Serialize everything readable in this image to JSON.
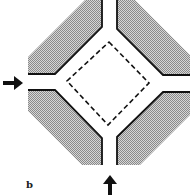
{
  "figure": {
    "panel_label": "b",
    "colors": {
      "shade": "#bdbdbd",
      "line": "#111111",
      "background": "#ffffff"
    },
    "arrows": [
      {
        "name": "left-inflow",
        "direction": "right"
      },
      {
        "name": "bottom-inflow",
        "direction": "up"
      }
    ],
    "center_region": {
      "shape": "diamond",
      "style": "dashed"
    }
  }
}
